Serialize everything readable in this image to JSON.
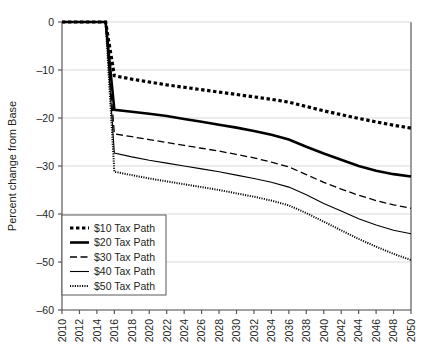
{
  "chart_data": {
    "type": "line",
    "title": "",
    "xlabel": "",
    "ylabel": "Percent change from Base",
    "xlim": [
      2010,
      2050
    ],
    "ylim": [
      -60,
      0
    ],
    "yticks": [
      0,
      -10,
      -20,
      -30,
      -40,
      -50,
      -60
    ],
    "ytick_labels": [
      "0",
      "–10",
      "–20",
      "–30",
      "–40",
      "–50",
      "–60"
    ],
    "grid": "horizontal",
    "legend_position": "lower-left",
    "x": [
      2010,
      2011,
      2012,
      2013,
      2014,
      2015,
      2016,
      2018,
      2020,
      2022,
      2024,
      2026,
      2028,
      2030,
      2032,
      2034,
      2036,
      2038,
      2040,
      2042,
      2044,
      2046,
      2048,
      2050
    ],
    "xticks": [
      2010,
      2012,
      2014,
      2016,
      2018,
      2020,
      2022,
      2024,
      2026,
      2028,
      2030,
      2032,
      2034,
      2036,
      2038,
      2040,
      2042,
      2044,
      2046,
      2048,
      2050
    ],
    "xtick_labels": [
      "2010",
      "2012",
      "2014",
      "2016",
      "2018",
      "2020",
      "2022",
      "2024",
      "2026",
      "2028",
      "2030",
      "2032",
      "2034",
      "2036",
      "2038",
      "2040",
      "2042",
      "2044",
      "2046",
      "2048",
      "2050"
    ],
    "series": [
      {
        "name": "$10 Tax Path",
        "style": "thick-dotted",
        "color": "#000000",
        "values": [
          0,
          0,
          0,
          0,
          0,
          0,
          -11.2,
          -11.9,
          -12.5,
          -13.1,
          -13.6,
          -14.1,
          -14.6,
          -15.1,
          -15.6,
          -16.1,
          -16.7,
          -17.6,
          -18.5,
          -19.3,
          -20.1,
          -20.8,
          -21.5,
          -22.1
        ]
      },
      {
        "name": "$20 Tax Path",
        "style": "thick-solid",
        "color": "#000000",
        "values": [
          0,
          0,
          0,
          0,
          0,
          0,
          -18.3,
          -18.7,
          -19.1,
          -19.6,
          -20.2,
          -20.8,
          -21.4,
          -22.0,
          -22.7,
          -23.5,
          -24.5,
          -26.0,
          -27.4,
          -28.7,
          -30.0,
          -31.0,
          -31.7,
          -32.2
        ]
      },
      {
        "name": "$30 Tax Path",
        "style": "dashed",
        "color": "#000000",
        "values": [
          0,
          0,
          0,
          0,
          0,
          0,
          -23.3,
          -23.9,
          -24.5,
          -25.1,
          -25.7,
          -26.3,
          -26.9,
          -27.6,
          -28.3,
          -29.2,
          -30.2,
          -31.8,
          -33.4,
          -34.8,
          -36.1,
          -37.2,
          -38.1,
          -38.8
        ]
      },
      {
        "name": "$40 Tax Path",
        "style": "thin-solid",
        "color": "#000000",
        "values": [
          0,
          0,
          0,
          0,
          0,
          0,
          -27.3,
          -28.1,
          -28.8,
          -29.4,
          -30.0,
          -30.6,
          -31.2,
          -31.9,
          -32.6,
          -33.4,
          -34.4,
          -36.0,
          -37.8,
          -39.4,
          -41.0,
          -42.3,
          -43.4,
          -44.1
        ]
      },
      {
        "name": "$50 Tax Path",
        "style": "fine-dotted",
        "color": "#000000",
        "values": [
          0,
          0,
          0,
          0,
          0,
          0,
          -31.2,
          -31.9,
          -32.6,
          -33.2,
          -33.8,
          -34.4,
          -35.0,
          -35.7,
          -36.4,
          -37.2,
          -38.2,
          -39.8,
          -41.6,
          -43.4,
          -45.2,
          -46.8,
          -48.3,
          -49.6
        ]
      }
    ]
  },
  "legend": {
    "items": [
      {
        "label": "$10 Tax Path"
      },
      {
        "label": "$20 Tax Path"
      },
      {
        "label": "$30 Tax Path"
      },
      {
        "label": "$40 Tax Path"
      },
      {
        "label": "$50 Tax Path"
      }
    ]
  },
  "colors": {
    "axis": "#58595b",
    "grid": "#d9d9d9",
    "text": "#231f20",
    "line": "#000000"
  }
}
